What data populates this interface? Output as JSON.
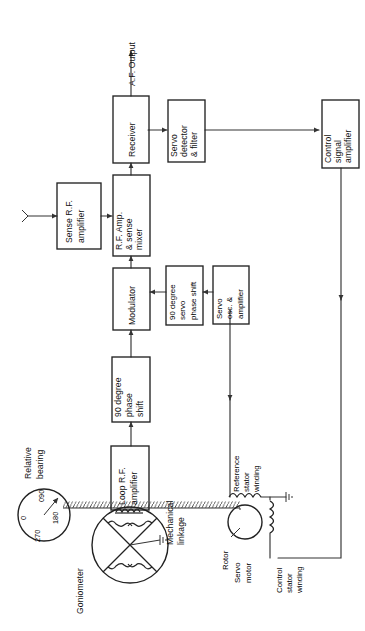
{
  "figure": {
    "type": "block-diagram",
    "orientation": "text rotated 90 degrees counter-clockwise"
  },
  "blocks": {
    "sense_rf_amplifier": "Sense R.F.\namplifier",
    "sense_rf_amplifier_lines": [
      "Sense R.F.",
      "amplifier"
    ],
    "rf_amp_sense_mixer_lines": [
      "R.F. Amp.",
      "& sense",
      "mixer"
    ],
    "receiver_lines": [
      "Receiver"
    ],
    "servo_detector_filter_lines": [
      "Servo",
      "detector",
      "& filter"
    ],
    "control_signal_amplifier_lines": [
      "Control",
      "signal",
      "amplifier"
    ],
    "modulator_lines": [
      "Modulator"
    ],
    "phase_shift_90_lines": [
      "90 degree",
      "phase",
      "shift"
    ],
    "servo_phase_shift_90_lines": [
      "90 degree",
      "servo",
      "phase shift"
    ],
    "servo_osc_amplifier_lines": [
      "Servo",
      "osc. &",
      "amplifier"
    ],
    "loop_rf_amplifier_lines": [
      "Loop R.F.",
      "amplifier"
    ]
  },
  "labels": {
    "af_output": "A.F. Output",
    "relative_bearing_lines": [
      "Relative",
      "bearing"
    ],
    "goniometer": "Goniometer",
    "mechanical_linkage_lines": [
      "Mechanical",
      "linkage"
    ],
    "reference_stator_winding_lines": [
      "Reference",
      "stator",
      "winding"
    ],
    "control_stator_winding_lines": [
      "Control",
      "stator",
      "winding"
    ],
    "rotor": "Rotor",
    "servo_motor_lines": [
      "Servo",
      "motor"
    ]
  },
  "dial": {
    "name": "relative-bearing-indicator",
    "ticks": [
      "0",
      "090",
      "180",
      "270"
    ],
    "tick_0": "0",
    "tick_090": "090",
    "tick_180": "180",
    "tick_270": "270",
    "pointer_bearing": "090"
  },
  "icons": {
    "antenna": "antenna-icon",
    "ground": "ground-icon",
    "arrow": "arrow-icon",
    "coil": "coil-icon",
    "hatching": "mechanical-linkage-hatch-icon"
  },
  "colors": {
    "background": "#ffffff",
    "stroke": "#222222",
    "text": "#111111"
  }
}
